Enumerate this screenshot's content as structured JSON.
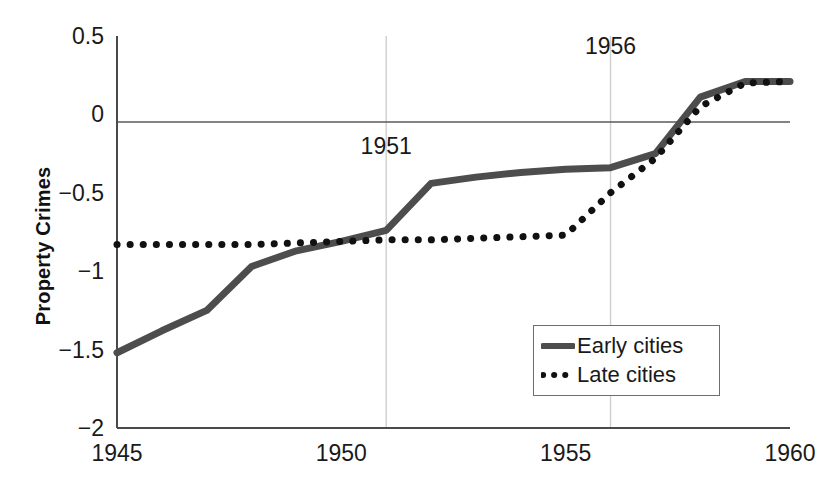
{
  "chart_data": {
    "type": "line",
    "title": "",
    "xlabel": "",
    "ylabel": "Property Crimes",
    "xlim": [
      1945,
      1960
    ],
    "ylim": [
      -2,
      0.5
    ],
    "grid": false,
    "legend_position": "bottom-right",
    "x_ticks": [
      "1945",
      "1950",
      "1955",
      "1960"
    ],
    "x_tick_values": [
      1945,
      1950,
      1955,
      1960
    ],
    "y_ticks": [
      "0.5",
      "0",
      "-0.5",
      "-1",
      "-1.5",
      "-2"
    ],
    "y_tick_values": [
      0.5,
      0,
      -0.5,
      -1,
      -1.5,
      -2
    ],
    "zero_line": 0,
    "x": [
      1945,
      1946,
      1947,
      1948,
      1949,
      1950,
      1951,
      1952,
      1953,
      1954,
      1955,
      1956,
      1957,
      1958,
      1959,
      1960
    ],
    "series": [
      {
        "name": "Early cities",
        "style": "solid",
        "color": "#4d4d4d",
        "values": [
          -1.52,
          -1.38,
          -1.25,
          -0.97,
          -0.87,
          -0.81,
          -0.74,
          -0.44,
          -0.4,
          -0.37,
          -0.35,
          -0.34,
          -0.25,
          0.11,
          0.21,
          0.21
        ]
      },
      {
        "name": "Late cities",
        "style": "dotted",
        "color": "#111111",
        "values": [
          -0.83,
          -0.83,
          -0.83,
          -0.83,
          -0.82,
          -0.81,
          -0.8,
          -0.8,
          -0.79,
          -0.78,
          -0.77,
          -0.5,
          -0.28,
          0.05,
          0.2,
          0.21
        ]
      }
    ],
    "annotations": [
      {
        "label": "1951",
        "x": 1951,
        "label_y": -0.22,
        "line_from": 0.5,
        "line_to": -2
      },
      {
        "label": "1956",
        "x": 1956,
        "label_y": 0.42,
        "line_from": 0.5,
        "line_to": -2
      }
    ]
  },
  "legend": {
    "items": [
      {
        "label": "Early cities",
        "style": "solid"
      },
      {
        "label": "Late cities",
        "style": "dotted"
      }
    ]
  }
}
